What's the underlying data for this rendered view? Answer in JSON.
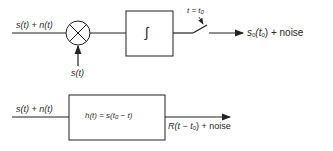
{
  "top_diagram": {
    "input_label": "s(t) + n(t)",
    "multiplier_input_label": "s(t)",
    "integrator_symbol": "∫",
    "switch_label": "t = t",
    "switch_label_sub": "0",
    "output_label_main": "s",
    "output_label_sub": "0",
    "output_label_arg": "(t",
    "output_label_arg_sub": "0",
    "output_label_tail": ") + noise"
  },
  "bottom_diagram": {
    "input_label": "s(t) + n(t)",
    "filter_label_prefix": "h(t) = s(t",
    "filter_label_sub": "0",
    "filter_label_suffix": " − t)",
    "output_label_prefix": "R(t − t",
    "output_label_sub": "0",
    "output_label_suffix": ") + noise"
  },
  "colors": {
    "line": "#222222",
    "background": "#ffffff"
  }
}
